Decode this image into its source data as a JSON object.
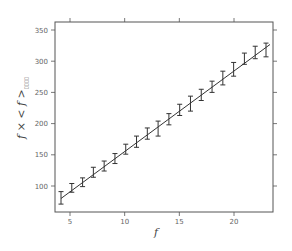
{
  "chart_data": {
    "type": "line",
    "title": "",
    "xlabel": "f",
    "ylabel": "f × < f >",
    "ylabel_subscript": "▯▯▯▯",
    "xlim": [
      3.5,
      24
    ],
    "ylim": [
      58,
      362
    ],
    "xticks": [
      5,
      10,
      15,
      20
    ],
    "yticks": [
      100,
      150,
      200,
      250,
      300,
      350
    ],
    "grid": false,
    "legend": null,
    "series": [
      {
        "name": "measured",
        "style": "errorbar",
        "x": [
          4,
          5,
          6,
          7,
          8,
          9,
          10,
          11,
          12,
          13,
          14,
          15,
          16,
          17,
          18,
          19,
          20,
          21,
          22,
          23
        ],
        "y": [
          81,
          97,
          106,
          122,
          132,
          144,
          159,
          171,
          184,
          192,
          207,
          222,
          232,
          246,
          259,
          273,
          287,
          304,
          314,
          318
        ],
        "err": [
          10,
          7,
          7,
          8,
          8,
          8,
          8,
          9,
          9,
          12,
          9,
          9,
          12,
          9,
          9,
          11,
          11,
          9,
          10,
          11
        ]
      },
      {
        "name": "linear fit",
        "style": "line",
        "x": [
          4,
          23
        ],
        "y": [
          80,
          322
        ]
      }
    ],
    "colors": {
      "axis": "#555555",
      "data": "#333333",
      "fit": "#333333",
      "tick_text": "#666666"
    }
  }
}
